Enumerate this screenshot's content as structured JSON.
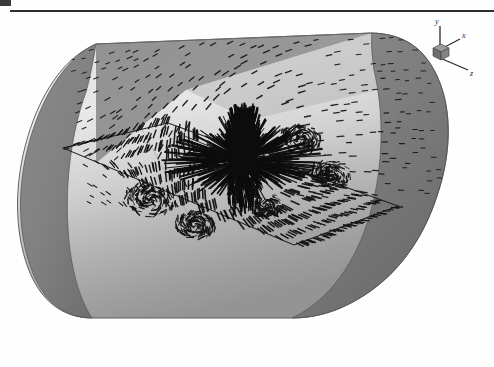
{
  "figure": {
    "title_rule": "horizontal-rule",
    "background_color": "#fefefe",
    "domain_shape": "cylinder",
    "render_style": "grayscale-shaded-surface"
  },
  "axis_triad": {
    "name": "orientation-axes-indicator",
    "x_label": "x",
    "y_label": "y",
    "z_label": "z",
    "cube_color": "#6e6e6e",
    "axis_color": "#2a2a2a"
  },
  "cylinder": {
    "body_light_color": "#dcdcdc",
    "body_mid_color": "#bdbdbd",
    "body_shadow_color": "#9a9a9a",
    "left_cap_color": "#808080",
    "right_cap_color": "#7a7a7a",
    "outline_color": "#4a4a4a"
  },
  "cut_plane": {
    "name": "rectangular-cutting-plane",
    "outline_color": "#1f1f1f",
    "fill": "transparent"
  },
  "vector_field": {
    "glyph_color": "#101010",
    "jet_center_x": 243,
    "jet_center_y": 160,
    "description": "radial-burst-velocity-vectors",
    "sparse_glyph_count": 430,
    "dense_glyph_count": 900,
    "plane_glyph_count": 240
  },
  "chart_data": {
    "type": "scatter",
    "title": "",
    "xlabel": "z",
    "ylabel": "y",
    "grid": false,
    "legend": "none"
  }
}
